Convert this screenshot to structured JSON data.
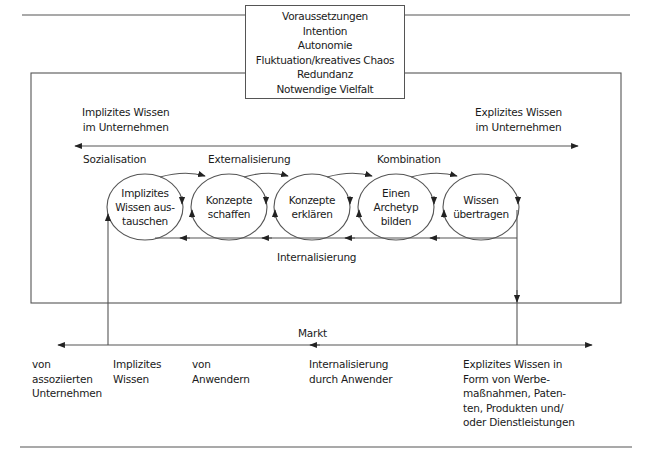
{
  "diagram": {
    "type": "knowledge-creation-process",
    "prerequisites_box": {
      "lines": [
        "Voraussetzungen",
        "Intention",
        "Autonomie",
        "Fluktuation/kreatives Chaos",
        "Redundanz",
        "Notwendige Vielfalt"
      ]
    },
    "company_axis": {
      "left_label_1": "Implizites Wissen",
      "left_label_2": "im Unternehmen",
      "right_label_1": "Explizites Wissen",
      "right_label_2": "im Unternehmen"
    },
    "phases": {
      "socialization": "Sozialisation",
      "externalization": "Externalisierung",
      "combination": "Kombination",
      "internalization": "Internalisierung"
    },
    "steps": [
      {
        "line1": "Implizites",
        "line2": "Wissen aus-",
        "line3": "tauschen"
      },
      {
        "line1": "Konzepte",
        "line2": "schaffen"
      },
      {
        "line1": "Konzepte",
        "line2": "erklären"
      },
      {
        "line1": "Einen",
        "line2": "Archetyp",
        "line3": "bilden"
      },
      {
        "line1": "Wissen",
        "line2": "übertragen"
      }
    ],
    "market": {
      "label": "Markt",
      "bottom_labels": [
        {
          "line1": "von",
          "line2": "assoziierten",
          "line3": "Unternehmen"
        },
        {
          "line1": "Implizites",
          "line2": "Wissen"
        },
        {
          "line1": "von",
          "line2": "Anwendern"
        },
        {
          "line1": "Internalisierung",
          "line2": "durch Anwender"
        },
        {
          "line1": "Explizites Wissen in",
          "line2": "Form von Werbe-",
          "line3": "maßnahmen, Paten-",
          "line4": "ten, Produkten und/",
          "line5": "oder Dienstleistungen"
        }
      ]
    },
    "colors": {
      "line": "#555555",
      "text": "#1a1a1a",
      "background": "#ffffff"
    }
  }
}
